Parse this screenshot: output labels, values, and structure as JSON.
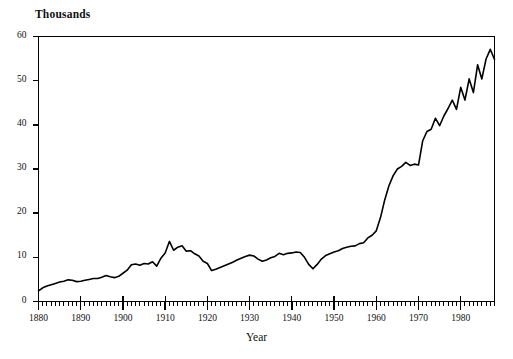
{
  "chart_data": {
    "type": "line",
    "title": "",
    "ylabel": "Thousands",
    "xlabel": "Year",
    "ylim": [
      0,
      60
    ],
    "xlim": [
      1880,
      1988
    ],
    "yticks": [
      0,
      10,
      20,
      30,
      40,
      50,
      60
    ],
    "xticks": [
      1880,
      1890,
      1900,
      1910,
      1920,
      1930,
      1940,
      1950,
      1960,
      1970,
      1980
    ],
    "xtick_labels": [
      "1880",
      "1890",
      "1900",
      "1910",
      "1920",
      "1930",
      "1940",
      "1950",
      "1960",
      "1970",
      "1980"
    ],
    "ytick_labels": [
      "0",
      "10",
      "20",
      "30",
      "40",
      "50",
      "60"
    ],
    "minor_tick_interval": 1,
    "grid": false,
    "legend": false,
    "line_color": "#000000",
    "line_width": 1.6,
    "background": "#ffffff",
    "frame": [
      "left",
      "bottom",
      "top",
      "right"
    ],
    "series": [
      {
        "name": "value",
        "x": [
          1880,
          1881,
          1882,
          1883,
          1884,
          1885,
          1886,
          1887,
          1888,
          1889,
          1890,
          1891,
          1892,
          1893,
          1894,
          1895,
          1896,
          1897,
          1898,
          1899,
          1900,
          1901,
          1902,
          1903,
          1904,
          1905,
          1906,
          1907,
          1908,
          1909,
          1910,
          1911,
          1912,
          1913,
          1914,
          1915,
          1916,
          1917,
          1918,
          1919,
          1920,
          1921,
          1922,
          1923,
          1924,
          1925,
          1926,
          1927,
          1928,
          1929,
          1930,
          1931,
          1932,
          1933,
          1934,
          1935,
          1936,
          1937,
          1938,
          1939,
          1940,
          1941,
          1942,
          1943,
          1944,
          1945,
          1946,
          1947,
          1948,
          1949,
          1950,
          1951,
          1952,
          1953,
          1954,
          1955,
          1956,
          1957,
          1958,
          1959,
          1960,
          1961,
          1962,
          1963,
          1964,
          1965,
          1966,
          1967,
          1968,
          1969,
          1970,
          1971,
          1972,
          1973,
          1974,
          1975,
          1976,
          1977,
          1978,
          1979,
          1980,
          1981,
          1982,
          1983,
          1984,
          1985,
          1986,
          1987,
          1988
        ],
        "y": [
          2.4,
          3.1,
          3.5,
          3.8,
          4.1,
          4.4,
          4.6,
          4.9,
          4.8,
          4.5,
          4.6,
          4.8,
          5.0,
          5.2,
          5.2,
          5.5,
          5.9,
          5.6,
          5.4,
          5.7,
          6.4,
          7.1,
          8.3,
          8.5,
          8.2,
          8.6,
          8.5,
          9.0,
          8.0,
          9.8,
          11.0,
          13.6,
          11.6,
          12.3,
          12.6,
          11.4,
          11.5,
          10.8,
          10.3,
          9.1,
          8.6,
          7.0,
          7.3,
          7.7,
          8.1,
          8.5,
          8.9,
          9.4,
          9.8,
          10.2,
          10.5,
          10.3,
          9.6,
          9.1,
          9.4,
          9.9,
          10.2,
          10.9,
          10.6,
          10.9,
          11.0,
          11.2,
          11.1,
          10.0,
          8.4,
          7.4,
          8.4,
          9.6,
          10.4,
          10.8,
          11.2,
          11.5,
          12.0,
          12.3,
          12.5,
          12.6,
          13.1,
          13.3,
          14.4,
          15.0,
          16.0,
          19.0,
          23.0,
          26.2,
          28.5,
          30.0,
          30.6,
          31.5,
          30.8,
          31.1,
          30.9,
          36.4,
          38.5,
          39.0,
          41.5,
          39.8,
          42.0,
          43.7,
          45.6,
          43.5,
          48.5,
          45.6,
          50.4,
          47.3,
          53.6,
          50.4,
          54.9,
          57.1,
          54.8
        ]
      }
    ]
  },
  "figure": {
    "ylabel_text": "Thousands",
    "xlabel_text": "Year"
  }
}
